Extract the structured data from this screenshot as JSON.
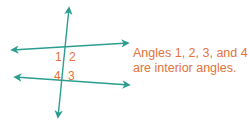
{
  "colors": {
    "line": "#2a9d8f",
    "label": "#e2733a"
  },
  "angle_labels": [
    {
      "text": "1",
      "x": 55,
      "y": 51
    },
    {
      "text": "2",
      "x": 69,
      "y": 51
    },
    {
      "text": "4",
      "x": 54,
      "y": 70
    },
    {
      "text": "3",
      "x": 68,
      "y": 70
    }
  ],
  "caption": {
    "line1": "Angles 1, 2, 3, and 4",
    "line2": "are interior angles."
  },
  "lines": {
    "transversal": {
      "x1": 69,
      "y1": 8,
      "x2": 58,
      "y2": 117
    },
    "top_line": {
      "x1": 12,
      "y1": 50,
      "x2": 128,
      "y2": 43
    },
    "bottom_line": {
      "x1": 15,
      "y1": 77,
      "x2": 129,
      "y2": 85
    }
  }
}
